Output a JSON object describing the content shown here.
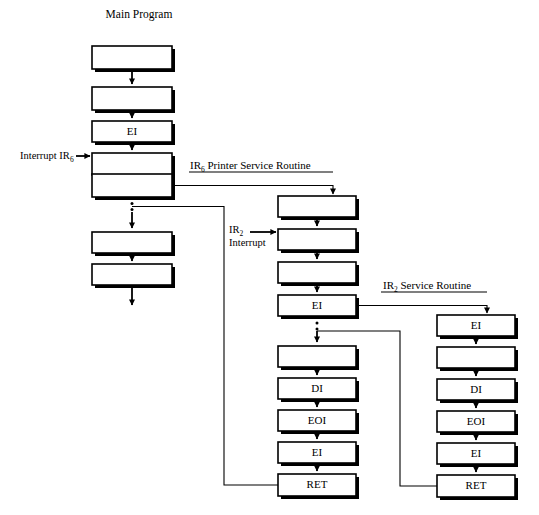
{
  "title": "Main Program",
  "columns": {
    "main": {
      "name": "Main Program",
      "boxes": [
        {
          "label": ""
        },
        {
          "label": ""
        },
        {
          "label": "EI"
        },
        {
          "label": ""
        },
        {
          "label": ""
        },
        {
          "label": ""
        },
        {
          "label": ""
        }
      ]
    },
    "printer": {
      "name": "IR6 Printer Service Routine",
      "title_main": "IR",
      "title_sub": "6",
      "title_rest": " Printer Service Routine",
      "boxes": [
        {
          "label": ""
        },
        {
          "label": ""
        },
        {
          "label": ""
        },
        {
          "label": "EI"
        },
        {
          "label": ""
        },
        {
          "label": "DI"
        },
        {
          "label": "EOI"
        },
        {
          "label": "EI"
        },
        {
          "label": "RET"
        }
      ]
    },
    "ir2": {
      "name": "IR2 Service Routine",
      "title_main": "IR",
      "title_sub": "2",
      "title_rest": " Service Routine",
      "boxes": [
        {
          "label": "EI"
        },
        {
          "label": ""
        },
        {
          "label": "DI"
        },
        {
          "label": "EOI"
        },
        {
          "label": "EI"
        },
        {
          "label": "RET"
        }
      ]
    }
  },
  "labels": {
    "interrupt_ir6_text": "Interrupt IR",
    "interrupt_ir6_sub": "6",
    "ir2_interrupt_line1_text": "IR",
    "ir2_interrupt_line1_sub": "2",
    "ir2_interrupt_line2": "Interrupt"
  },
  "colors": {
    "stroke": "#000000",
    "fill": "#ffffff",
    "background": "#ffffff"
  }
}
